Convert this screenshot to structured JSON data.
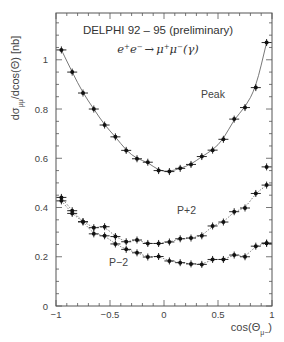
{
  "chart_data": {
    "type": "scatter",
    "subtitle": "e+e- → μ+μ-(γ)",
    "xlabel": "cos(Θμ-)",
    "ylabel": "dσμμ/dcos(Θ) [nb]",
    "xlim": [
      -1,
      1
    ],
    "ylim": [
      0,
      1.19
    ],
    "x_ticks": [
      -1,
      -0.5,
      0,
      0.5,
      1
    ],
    "x_tick_labels": [
      "-1",
      "-0.5",
      "0",
      "0.5",
      "1"
    ],
    "y_ticks": [
      0,
      0.2,
      0.4,
      0.6,
      0.8,
      1
    ],
    "y_tick_labels": [
      "0",
      "0.2",
      "0.4",
      "0.6",
      "0.8",
      "1"
    ],
    "grid": false,
    "legend": "none (curves labeled inline)",
    "x": [
      -0.95,
      -0.85,
      -0.75,
      -0.65,
      -0.55,
      -0.45,
      -0.35,
      -0.25,
      -0.15,
      -0.05,
      0.05,
      0.15,
      0.25,
      0.35,
      0.45,
      0.55,
      0.65,
      0.75,
      0.85,
      0.95
    ],
    "series": [
      {
        "name": "Peak",
        "label_pos": [
          0.35,
          0.86
        ],
        "fit_style": "solid",
        "values": [
          1.04,
          0.95,
          0.865,
          0.8,
          0.735,
          0.687,
          0.632,
          0.598,
          0.584,
          0.55,
          0.546,
          0.559,
          0.575,
          0.607,
          0.633,
          0.677,
          0.759,
          0.806,
          0.887,
          1.07
        ]
      },
      {
        "name": "P+2",
        "label_pos": [
          0.14,
          0.39
        ],
        "fit_style": "dotted",
        "values": [
          0.441,
          0.387,
          0.342,
          0.318,
          0.322,
          0.282,
          0.261,
          0.268,
          0.254,
          0.254,
          0.26,
          0.273,
          0.276,
          0.285,
          0.325,
          0.341,
          0.383,
          0.398,
          0.457,
          0.491
        ]
      },
      {
        "name": "P-2",
        "label_pos": [
          -0.5,
          0.18
        ],
        "fit_style": "dotted",
        "values": [
          0.427,
          0.376,
          0.342,
          0.293,
          0.285,
          0.252,
          0.23,
          0.216,
          0.199,
          0.201,
          0.183,
          0.176,
          0.171,
          0.169,
          0.189,
          0.189,
          0.207,
          0.2,
          0.243,
          0.255
        ]
      }
    ],
    "extra_points": {
      "P+2": [
        [
          0.95,
          0.565
        ]
      ],
      "P-2": [
        [
          0.95,
          0.255
        ]
      ]
    }
  },
  "labels": {
    "title": "DELPHI 92 – 95  (preliminary)",
    "formula_e": "e",
    "formula_plus": "+",
    "formula_e2": "e",
    "formula_minus": "−",
    "formula_arrow": "→",
    "formula_mu": "μ",
    "formula_mu2": "μ",
    "formula_gamma": "(γ)",
    "ylabel_main": "dσ",
    "ylabel_sub": "μμ",
    "ylabel_rest": "/dcos(Θ) [nb]",
    "xlabel_main": "cos(Θ",
    "xlabel_sub": "μ−",
    "xlabel_close": ")",
    "peak": "Peak",
    "p_plus_2": "P+2",
    "p_minus_2": "P−2"
  },
  "colors": {
    "frame": "#555555",
    "marker": "#111111",
    "fit": "#555555",
    "text": "#333333"
  }
}
